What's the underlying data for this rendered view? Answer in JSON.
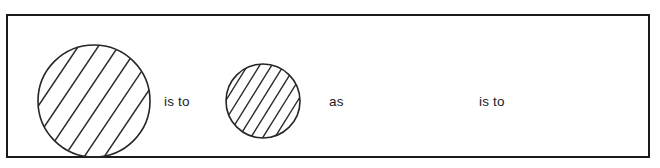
{
  "figure": {
    "kind": "visual-analogy-item",
    "frame": {
      "border_color": "#1a1a1a",
      "fill_color": "#ffffff"
    },
    "terms": [
      {
        "role": "term-a",
        "shape": "circle",
        "size": "large",
        "fill": "diagonal-hatch",
        "hatch_direction": "lower-left-to-upper-right",
        "hatch_line_count": 7,
        "hatch_spacing": "wide",
        "radius_px": 56,
        "center_x_px": 86,
        "center_y_px": 85,
        "stroke_color": "#262626"
      },
      {
        "role": "term-b",
        "shape": "circle",
        "size": "small",
        "fill": "diagonal-hatch",
        "hatch_direction": "lower-left-to-upper-right",
        "hatch_line_count": 9,
        "hatch_spacing": "narrow",
        "radius_px": 37,
        "center_x_px": 255,
        "center_y_px": 85,
        "stroke_color": "#262626"
      },
      {
        "role": "term-c",
        "shape": "blank",
        "fill": "none",
        "note": "empty answer space"
      }
    ],
    "relations": {
      "first_is_to": "is to",
      "as": "as",
      "second_is_to": "is to"
    }
  }
}
